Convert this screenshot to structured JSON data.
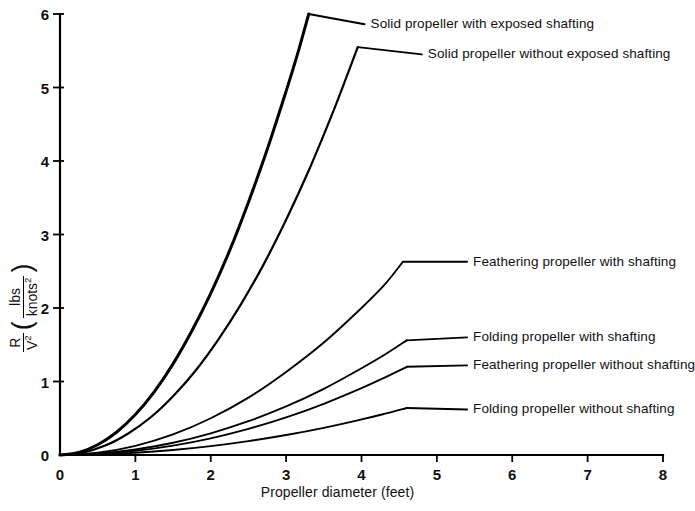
{
  "chart_data": {
    "type": "line",
    "title": "",
    "xlabel": "Propeller diameter (feet)",
    "ylabel_numerator": "R",
    "ylabel_denominator": "V",
    "ylabel_denominator_exp": "2",
    "yunits_numerator": "lbs",
    "yunits_denominator": "knots",
    "yunits_denominator_exp": "2",
    "xlim": [
      0,
      8
    ],
    "ylim": [
      0,
      6
    ],
    "xticks": [
      "0",
      "1",
      "2",
      "3",
      "4",
      "5",
      "6",
      "7",
      "8"
    ],
    "yticks": [
      "0",
      "1",
      "2",
      "3",
      "4",
      "5",
      "6"
    ],
    "grid": false,
    "legend_position": "inline-labels",
    "series": [
      {
        "name": "Solid propeller with exposed shafting",
        "label_x": 4.12,
        "label_y": 5.86,
        "x": [
          0,
          0.25,
          0.5,
          0.75,
          1.0,
          1.25,
          1.5,
          1.75,
          2.0,
          2.25,
          2.5,
          2.75,
          3.0,
          3.15,
          3.3
        ],
        "values": [
          0,
          0.035,
          0.14,
          0.31,
          0.55,
          0.86,
          1.24,
          1.69,
          2.2,
          2.78,
          3.44,
          4.16,
          4.95,
          5.45,
          6.0
        ]
      },
      {
        "name": "Solid propeller without exposed shafting",
        "label_x": 4.88,
        "label_y": 5.45,
        "x": [
          0,
          0.3,
          0.6,
          0.9,
          1.2,
          1.5,
          1.8,
          2.1,
          2.4,
          2.7,
          3.0,
          3.3,
          3.6,
          3.8,
          3.95
        ],
        "values": [
          0,
          0.032,
          0.128,
          0.29,
          0.51,
          0.8,
          1.15,
          1.57,
          2.05,
          2.59,
          3.2,
          3.87,
          4.61,
          5.14,
          5.55
        ]
      },
      {
        "name": "Feathering propeller with shafting",
        "label_x": 5.48,
        "label_y": 2.63,
        "x": [
          0,
          0.5,
          1.0,
          1.5,
          2.0,
          2.5,
          3.0,
          3.5,
          4.0,
          4.3,
          4.55
        ],
        "values": [
          0,
          0.03,
          0.125,
          0.28,
          0.5,
          0.78,
          1.13,
          1.53,
          2.0,
          2.31,
          2.63
        ]
      },
      {
        "name": "Folding propeller with shafting",
        "label_x": 5.48,
        "label_y": 1.6,
        "x": [
          0,
          0.5,
          1.0,
          1.5,
          2.0,
          2.5,
          3.0,
          3.5,
          4.0,
          4.3,
          4.6
        ],
        "values": [
          0,
          0.018,
          0.074,
          0.166,
          0.295,
          0.46,
          0.66,
          0.9,
          1.18,
          1.36,
          1.56
        ]
      },
      {
        "name": "Feathering propeller without shafting",
        "label_x": 5.48,
        "label_y": 1.22,
        "x": [
          0,
          0.5,
          1.0,
          1.5,
          2.0,
          2.5,
          3.0,
          3.5,
          4.0,
          4.3,
          4.6
        ],
        "values": [
          0,
          0.014,
          0.057,
          0.128,
          0.227,
          0.355,
          0.511,
          0.696,
          0.909,
          1.05,
          1.2
        ]
      },
      {
        "name": "Folding propeller without shafting",
        "label_x": 5.48,
        "label_y": 0.62,
        "x": [
          0,
          0.5,
          1.0,
          1.5,
          2.0,
          2.5,
          3.0,
          3.5,
          4.0,
          4.3,
          4.6
        ],
        "values": [
          0,
          0.0076,
          0.03,
          0.068,
          0.121,
          0.189,
          0.272,
          0.37,
          0.484,
          0.559,
          0.64
        ]
      }
    ],
    "colors": {
      "axis": "#000000",
      "curve": "#000000",
      "background": "#ffffff"
    }
  }
}
